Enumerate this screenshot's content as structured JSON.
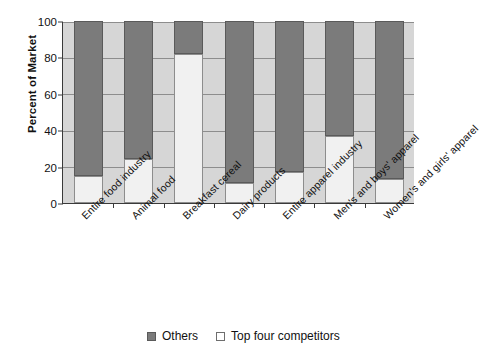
{
  "chart_data": {
    "type": "bar",
    "subtype": "stacked-percent",
    "title": "",
    "xlabel": "",
    "ylabel": "Percent of Market",
    "ylim": [
      0,
      100
    ],
    "yticks": [
      0,
      20,
      40,
      60,
      80,
      100
    ],
    "ytick_labels": [
      "0",
      "20",
      "40",
      "60",
      "80",
      "100"
    ],
    "grid": true,
    "legend_position": "bottom",
    "categories": [
      "Entire food industry",
      "Animal food",
      "Breakfast cereal",
      "Dairy products",
      "Entire apparel industry",
      "Men's and boys' apparel",
      "Women's and girls' apparel"
    ],
    "series": [
      {
        "name": "Top four competitors",
        "color": "#f1f1f1",
        "values": [
          15,
          24,
          82,
          11,
          17,
          37,
          13
        ]
      },
      {
        "name": "Others",
        "color": "#7b7b7b",
        "values": [
          85,
          76,
          18,
          89,
          83,
          63,
          87
        ]
      }
    ],
    "legend": [
      {
        "label": "Others",
        "color": "#7b7b7b"
      },
      {
        "label": "Top four competitors",
        "color": "#f1f1f1"
      }
    ]
  },
  "colors": {
    "plot_background": "#d6d6d6",
    "gridline": "#8d8d8d",
    "axis": "#3a3a3a",
    "others": "#7b7b7b",
    "top_four": "#f1f1f1",
    "text": "#111111",
    "page_background": "#ffffff"
  }
}
